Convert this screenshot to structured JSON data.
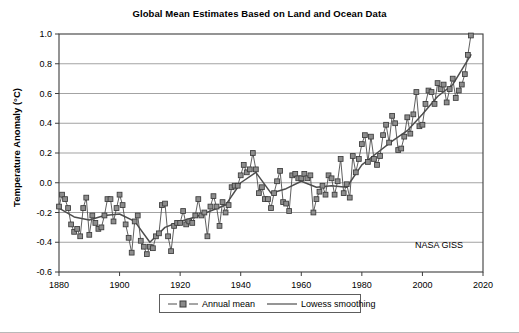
{
  "chart_data": {
    "type": "line",
    "title": "Global Mean Estimates Based on Land and Ocean Data",
    "xlabel": "",
    "ylabel": "Temperature Anomaly (°C)",
    "xlim": [
      1880,
      2020
    ],
    "ylim": [
      -0.6,
      1.0
    ],
    "xticks": [
      1880,
      1900,
      1920,
      1940,
      1960,
      1980,
      2000,
      2020
    ],
    "yticks": [
      -0.6,
      -0.4,
      -0.2,
      0.0,
      0.2,
      0.4,
      0.6,
      0.8,
      1.0
    ],
    "grid": "horizontal",
    "legend_position": "bottom-center",
    "annotation": "NASA GISS",
    "series": [
      {
        "name": "Annual mean",
        "style": "line-with-square-markers",
        "color": "#4d4d4d",
        "x": [
          1880,
          1881,
          1882,
          1883,
          1884,
          1885,
          1886,
          1887,
          1888,
          1889,
          1890,
          1891,
          1892,
          1893,
          1894,
          1895,
          1896,
          1897,
          1898,
          1899,
          1900,
          1901,
          1902,
          1903,
          1904,
          1905,
          1906,
          1907,
          1908,
          1909,
          1910,
          1911,
          1912,
          1913,
          1914,
          1915,
          1916,
          1917,
          1918,
          1919,
          1920,
          1921,
          1922,
          1923,
          1924,
          1925,
          1926,
          1927,
          1928,
          1929,
          1930,
          1931,
          1932,
          1933,
          1934,
          1935,
          1936,
          1937,
          1938,
          1939,
          1940,
          1941,
          1942,
          1943,
          1944,
          1945,
          1946,
          1947,
          1948,
          1949,
          1950,
          1951,
          1952,
          1953,
          1954,
          1955,
          1956,
          1957,
          1958,
          1959,
          1960,
          1961,
          1962,
          1963,
          1964,
          1965,
          1966,
          1967,
          1968,
          1969,
          1970,
          1971,
          1972,
          1973,
          1974,
          1975,
          1976,
          1977,
          1978,
          1979,
          1980,
          1981,
          1982,
          1983,
          1984,
          1985,
          1986,
          1987,
          1988,
          1989,
          1990,
          1991,
          1992,
          1993,
          1994,
          1995,
          1996,
          1997,
          1998,
          1999,
          2000,
          2001,
          2002,
          2003,
          2004,
          2005,
          2006,
          2007,
          2008,
          2009,
          2010,
          2011,
          2012,
          2013,
          2014,
          2015,
          2016
        ],
        "values": [
          -0.16,
          -0.08,
          -0.11,
          -0.17,
          -0.28,
          -0.33,
          -0.31,
          -0.36,
          -0.17,
          -0.1,
          -0.35,
          -0.22,
          -0.27,
          -0.31,
          -0.3,
          -0.22,
          -0.11,
          -0.11,
          -0.26,
          -0.17,
          -0.08,
          -0.15,
          -0.28,
          -0.37,
          -0.47,
          -0.26,
          -0.22,
          -0.39,
          -0.43,
          -0.48,
          -0.43,
          -0.44,
          -0.36,
          -0.34,
          -0.15,
          -0.14,
          -0.36,
          -0.46,
          -0.29,
          -0.27,
          -0.27,
          -0.19,
          -0.28,
          -0.26,
          -0.27,
          -0.22,
          -0.11,
          -0.22,
          -0.2,
          -0.36,
          -0.16,
          -0.09,
          -0.16,
          -0.29,
          -0.13,
          -0.2,
          -0.15,
          -0.03,
          -0.02,
          -0.02,
          0.05,
          0.12,
          0.07,
          0.09,
          0.2,
          0.09,
          -0.07,
          -0.03,
          -0.11,
          -0.11,
          -0.17,
          -0.07,
          0.01,
          0.08,
          -0.13,
          -0.14,
          -0.19,
          0.05,
          0.06,
          0.03,
          0.03,
          0.06,
          0.03,
          0.05,
          -0.2,
          -0.11,
          -0.06,
          -0.02,
          -0.08,
          0.05,
          0.03,
          -0.08,
          0.01,
          0.16,
          -0.07,
          -0.01,
          -0.1,
          0.18,
          0.07,
          0.16,
          0.26,
          0.32,
          0.14,
          0.31,
          0.16,
          0.12,
          0.18,
          0.32,
          0.39,
          0.27,
          0.45,
          0.4,
          0.22,
          0.23,
          0.31,
          0.44,
          0.33,
          0.46,
          0.61,
          0.38,
          0.39,
          0.53,
          0.62,
          0.61,
          0.53,
          0.67,
          0.63,
          0.66,
          0.54,
          0.63,
          0.7,
          0.57,
          0.62,
          0.66,
          0.73,
          0.86,
          0.99
        ]
      },
      {
        "name": "Lowess smoothing",
        "style": "line",
        "color": "#4d4d4d",
        "x": [
          1880,
          1885,
          1890,
          1895,
          1900,
          1905,
          1910,
          1915,
          1920,
          1925,
          1930,
          1935,
          1940,
          1945,
          1950,
          1955,
          1960,
          1965,
          1970,
          1975,
          1980,
          1985,
          1990,
          1995,
          2000,
          2005,
          2010,
          2016
        ],
        "values": [
          -0.17,
          -0.23,
          -0.25,
          -0.22,
          -0.21,
          -0.26,
          -0.4,
          -0.3,
          -0.26,
          -0.23,
          -0.19,
          -0.15,
          0.0,
          0.07,
          -0.07,
          -0.04,
          0.01,
          -0.03,
          -0.02,
          -0.03,
          0.12,
          0.2,
          0.28,
          0.35,
          0.46,
          0.58,
          0.66,
          0.86
        ]
      }
    ]
  },
  "legend": {
    "items": [
      {
        "label": "Annual mean",
        "symbol": "dashed-line-square-marker"
      },
      {
        "label": "Lowess smoothing",
        "symbol": "solid-line"
      }
    ]
  }
}
